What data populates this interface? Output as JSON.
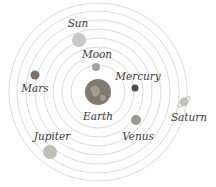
{
  "center": {
    "x": 98,
    "y": 92
  },
  "orbits": [
    {
      "r": 27
    },
    {
      "r": 36
    },
    {
      "r": 45
    },
    {
      "r": 54
    },
    {
      "r": 63
    },
    {
      "r": 72
    },
    {
      "r": 81
    },
    {
      "r": 89
    }
  ],
  "bodies": [
    {
      "name": "Earth",
      "label": "Earth",
      "x": 98,
      "y": 92,
      "r": 13,
      "color": "#7f7a72",
      "label_x": 98,
      "label_y": 120
    },
    {
      "name": "Moon",
      "label": "Moon",
      "x": 96,
      "y": 67,
      "r": 4,
      "color": "#a9a4a0",
      "label_x": 97,
      "label_y": 58
    },
    {
      "name": "Mercury",
      "label": "Mercury",
      "x": 135,
      "y": 88,
      "r": 3.5,
      "color": "#4e4c4c",
      "label_x": 138,
      "label_y": 80
    },
    {
      "name": "Venus",
      "label": "Venus",
      "x": 136,
      "y": 120,
      "r": 5,
      "color": "#9d9792",
      "label_x": 138,
      "label_y": 140
    },
    {
      "name": "Sun",
      "label": "Sun",
      "x": 79,
      "y": 40,
      "r": 7,
      "color": "#cbc7c2",
      "label_x": 78,
      "label_y": 27
    },
    {
      "name": "Mars",
      "label": "Mars",
      "x": 35,
      "y": 75,
      "r": 4.5,
      "color": "#7f6f6c",
      "label_x": 35,
      "label_y": 92
    },
    {
      "name": "Jupiter",
      "label": "Jupiter",
      "x": 50,
      "y": 152,
      "r": 7,
      "color": "#c1bdb8",
      "label_x": 52,
      "label_y": 140
    },
    {
      "name": "Saturn",
      "label": "Saturn",
      "x": 184,
      "y": 102,
      "r": 4.5,
      "color": "#c7c3c0",
      "label_x": 189,
      "label_y": 121
    }
  ]
}
